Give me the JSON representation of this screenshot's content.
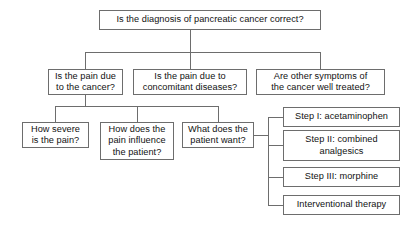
{
  "diagram": {
    "line_color": "#6d6d6d",
    "box_border_color": "#6d6d6d",
    "background_color": "#ffffff",
    "text_color": "#111111",
    "nodes": {
      "root": "Is the diagnosis of pancreatic cancer correct?",
      "branch_pain_cancer": "Is the pain due\nto the cancer?",
      "branch_pain_concomitant": "Is the pain due to\nconcomitant diseases?",
      "branch_other_symptoms": "Are other symptoms of\nthe cancer well treated?",
      "how_severe": "How severe\nis the pain?",
      "how_influence": "How does the\npain influence\nthe patient?",
      "patient_want": "What does the\npatient want?",
      "step_1": "Step I: acetaminophen",
      "step_2": "Step II: combined\nanalgesics",
      "step_3": "Step III: morphine",
      "interventional": "Interventional therapy"
    }
  }
}
